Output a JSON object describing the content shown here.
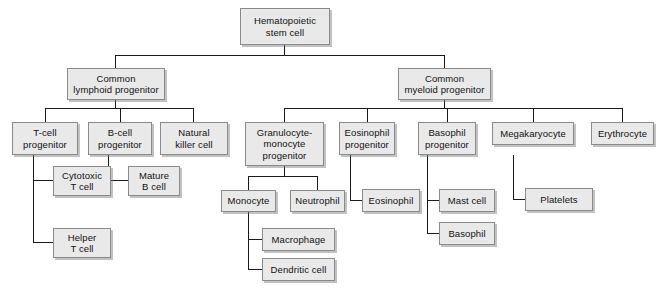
{
  "diagram": {
    "box_fill": "#e9e9e9",
    "box_border": "#8a8a8a",
    "line_color": "#1b1b1b",
    "background": "#ffffff"
  },
  "nodes": {
    "hematopoietic_stem_cell": "Hematopoietic\nstem cell",
    "common_lymphoid_progenitor": "Common\nlymphoid progenitor",
    "common_myeloid_progenitor": "Common\nmyeloid progenitor",
    "t_cell_progenitor": "T-cell\nprogenitor",
    "b_cell_progenitor": "B-cell\nprogenitor",
    "natural_killer_cell": "Natural\nkiller cell",
    "cytotoxic_t_cell": "Cytotoxic\nT cell",
    "helper_t_cell": "Helper\nT cell",
    "mature_b_cell": "Mature\nB cell",
    "granulocyte_monocyte_progenitor": "Granulocyte-\nmonocyte\nprogenitor",
    "eosinophil_progenitor": "Eosinophil\nprogenitor",
    "basophil_progenitor": "Basophil\nprogenitor",
    "megakaryocyte": "Megakaryocyte",
    "erythrocyte": "Erythrocyte",
    "monocyte": "Monocyte",
    "neutrophil": "Neutrophil",
    "macrophage": "Macrophage",
    "dendritic_cell": "Dendritic cell",
    "eosinophil": "Eosinophil",
    "mast_cell": "Mast cell",
    "basophil": "Basophil",
    "platelets": "Platelets"
  },
  "hierarchy": {
    "root": "hematopoietic_stem_cell",
    "edges": [
      [
        "hematopoietic_stem_cell",
        "common_lymphoid_progenitor"
      ],
      [
        "hematopoietic_stem_cell",
        "common_myeloid_progenitor"
      ],
      [
        "common_lymphoid_progenitor",
        "t_cell_progenitor"
      ],
      [
        "common_lymphoid_progenitor",
        "b_cell_progenitor"
      ],
      [
        "common_lymphoid_progenitor",
        "natural_killer_cell"
      ],
      [
        "t_cell_progenitor",
        "cytotoxic_t_cell"
      ],
      [
        "t_cell_progenitor",
        "helper_t_cell"
      ],
      [
        "b_cell_progenitor",
        "mature_b_cell"
      ],
      [
        "common_myeloid_progenitor",
        "granulocyte_monocyte_progenitor"
      ],
      [
        "common_myeloid_progenitor",
        "eosinophil_progenitor"
      ],
      [
        "common_myeloid_progenitor",
        "basophil_progenitor"
      ],
      [
        "common_myeloid_progenitor",
        "megakaryocyte"
      ],
      [
        "common_myeloid_progenitor",
        "erythrocyte"
      ],
      [
        "granulocyte_monocyte_progenitor",
        "monocyte"
      ],
      [
        "granulocyte_monocyte_progenitor",
        "neutrophil"
      ],
      [
        "monocyte",
        "macrophage"
      ],
      [
        "monocyte",
        "dendritic_cell"
      ],
      [
        "eosinophil_progenitor",
        "eosinophil"
      ],
      [
        "basophil_progenitor",
        "mast_cell"
      ],
      [
        "basophil_progenitor",
        "basophil"
      ],
      [
        "megakaryocyte",
        "platelets"
      ]
    ]
  }
}
